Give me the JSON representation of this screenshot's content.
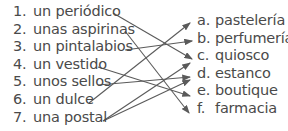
{
  "left_items": [
    {
      "num": "1.",
      "text": "un periódico"
    },
    {
      "num": "2.",
      "text": "unas aspirinas"
    },
    {
      "num": "3.",
      "text": "un pintalabios"
    },
    {
      "num": "4.",
      "text": "un vestido"
    },
    {
      "num": "5.",
      "text": "unos sellos"
    },
    {
      "num": "6.",
      "text": "un dulce"
    },
    {
      "num": "7.",
      "text": "una postal"
    }
  ],
  "right_items": [
    {
      "letter": "a.",
      "text": "pastelería"
    },
    {
      "letter": "b.",
      "text": "perfumería"
    },
    {
      "letter": "c.",
      "text": "quiosco"
    },
    {
      "letter": "d.",
      "text": "estanco"
    },
    {
      "letter": "e.",
      "text": "boutique"
    },
    {
      "letter": "f.",
      "text": "farmacia"
    }
  ],
  "connections": [
    {
      "from": "1",
      "to": "c"
    },
    {
      "from": "2",
      "to": "f"
    },
    {
      "from": "3",
      "to": "b"
    },
    {
      "from": "4",
      "to": "e"
    },
    {
      "from": "5",
      "to": "d"
    },
    {
      "from": "6",
      "to": "a"
    },
    {
      "from": "7",
      "to": "c"
    },
    {
      "from": "7",
      "to": "d"
    }
  ],
  "colors": {
    "line": "#5a5a5a",
    "text": "#4a4a4a"
  }
}
